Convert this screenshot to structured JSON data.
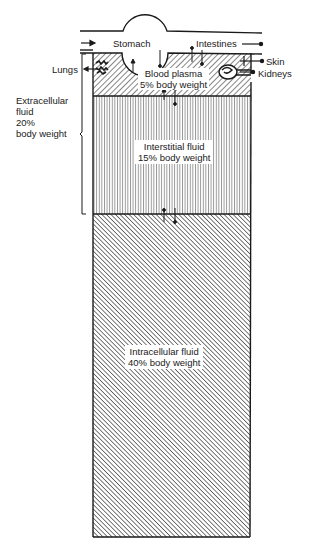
{
  "diagram": {
    "compartments": {
      "plasma": {
        "name": "Blood plasma",
        "share": "5% body weight"
      },
      "interstitial": {
        "name": "Interstitial fluid",
        "share": "15% body weight"
      },
      "intracellular": {
        "name": "Intracellular fluid",
        "share": "40% body weight"
      }
    },
    "extracellular": {
      "line1": "Extracellular",
      "line2": "fluid",
      "line3": "20%",
      "line4": "body weight"
    },
    "organs": {
      "stomach": "Stomach",
      "intestines": "Intestines",
      "lungs": "Lungs",
      "skin": "Skin",
      "kidneys": "Kidneys"
    },
    "colors": {
      "ink": "#1a1a1a",
      "background": "#ffffff"
    }
  }
}
